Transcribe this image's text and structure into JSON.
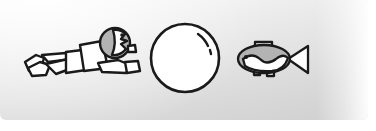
{
  "illustration": {
    "title": "Swimmer, ball and fish line drawing",
    "background": {
      "top_color": "#fbfbfb",
      "bottom_color": "#d0d0d0",
      "page_color": "#ffffff"
    },
    "ink_color": "#1a1a1a",
    "fill_white": "#ffffff",
    "fill_gray": "#b8b8b8",
    "figures": [
      {
        "name": "swimmer",
        "label": "child swimming",
        "parts": [
          "head",
          "face-profile",
          "eye",
          "ear",
          "torso",
          "arm",
          "hand",
          "legs",
          "feet"
        ],
        "head_fill": "#b3b3b3",
        "body_fill": "#ffffff",
        "x": 22,
        "y": 26,
        "width": 118,
        "height": 52
      },
      {
        "name": "ball",
        "label": "beach ball",
        "parts": [
          "sphere-outline",
          "highlight-arc",
          "highlight-dot"
        ],
        "fill": "#ffffff",
        "x": 148,
        "y": 20,
        "width": 72,
        "height": 72
      },
      {
        "name": "fish",
        "label": "fish",
        "parts": [
          "body",
          "belly-stripe",
          "eye",
          "dorsal-fin",
          "tail-fin",
          "pelvic-fins"
        ],
        "body_fill": "#b3b3b3",
        "belly_fill": "#ffffff",
        "x": 234,
        "y": 38,
        "width": 76,
        "height": 40
      }
    ]
  }
}
